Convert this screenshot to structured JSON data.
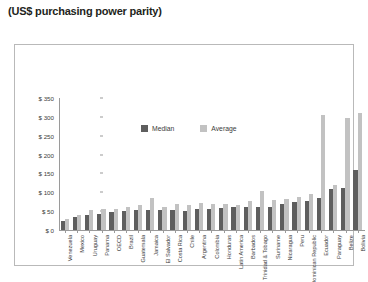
{
  "caption": "(US$ purchasing power parity)",
  "source": "Source: Galperin (2012)",
  "legend": {
    "median_label": "Median",
    "average_label": "Average",
    "median_color": "#5e5e5e",
    "average_color": "#c2c2c2"
  },
  "chart_data": {
    "type": "bar",
    "title": "(US$ purchasing power parity)",
    "xlabel": "",
    "ylabel": "",
    "ylim": [
      0,
      350
    ],
    "yticks": [
      0,
      50,
      100,
      150,
      200,
      250,
      300,
      350
    ],
    "ytick_labels": [
      "$ 0",
      "$ 50",
      "$ 100",
      "$ 150",
      "$ 200",
      "$ 250",
      "$ 300",
      "$ 350"
    ],
    "grid": false,
    "legend_position": "top-center",
    "categories": [
      "Venezuela",
      "Mexico",
      "Uruguay",
      "Panama",
      "OECD",
      "Brazil",
      "Guatemala",
      "Jamaica",
      "El Salvador",
      "Costa Rica",
      "Chile",
      "Argentina",
      "Colombia",
      "Honduras",
      "Latin America",
      "Barbados",
      "Trinidad & Tobago",
      "Suriname",
      "Nicaragua",
      "Peru",
      "Dominican Republic",
      "Ecuador",
      "Paraguay",
      "Belize",
      "Bolivia"
    ],
    "series": [
      {
        "name": "Median",
        "color": "#5e5e5e",
        "values": [
          24,
          34,
          40,
          42,
          48,
          50,
          52,
          52,
          52,
          54,
          50,
          56,
          56,
          58,
          60,
          60,
          62,
          62,
          68,
          74,
          78,
          84,
          108,
          112,
          160
        ]
      },
      {
        "name": "Average",
        "color": "#c2c2c2",
        "values": [
          28,
          40,
          54,
          56,
          56,
          62,
          66,
          84,
          62,
          70,
          66,
          72,
          68,
          70,
          66,
          76,
          104,
          80,
          82,
          88,
          96,
          306,
          120,
          298,
          310
        ]
      }
    ]
  }
}
